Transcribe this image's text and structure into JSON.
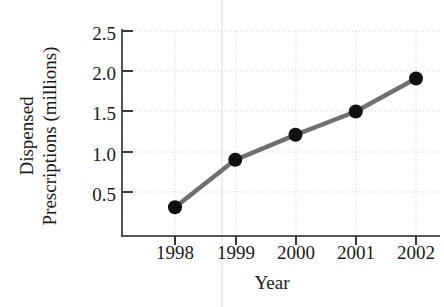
{
  "chart_data": {
    "type": "line",
    "title": "",
    "subtitle": "",
    "xlabel": "Year",
    "ylabel": "Dispensed Prescriptions (millions)",
    "ylabel_lines": [
      "Dispensed",
      "Prescriptions (millions)"
    ],
    "categories": [
      "1998",
      "1999",
      "2000",
      "2001",
      "2002"
    ],
    "x": [
      1998,
      1999,
      2000,
      2001,
      2002
    ],
    "values": [
      0.31,
      0.9,
      1.21,
      1.5,
      1.91
    ],
    "series": [
      {
        "name": "Dispensed Prescriptions",
        "values": [
          0.31,
          0.9,
          1.21,
          1.5,
          1.91
        ]
      }
    ],
    "ytick_labels": [
      "0.5",
      "1.0",
      "1.5",
      "2.0",
      "2.5"
    ],
    "yticks": [
      0.5,
      1.0,
      1.5,
      2.0,
      2.5
    ],
    "xtick_labels": [
      "1998",
      "1999",
      "2000",
      "2001",
      "2002"
    ],
    "ylim": [
      0.0,
      2.68
    ],
    "xlim": [
      1997.75,
      2002.25
    ],
    "grid": true,
    "grid_style": "dotted",
    "legend": false,
    "legend_position": "none",
    "annotations": [],
    "colors": {
      "line": "#707070",
      "marker": "#101010",
      "grid": "#c9c9c9",
      "axis": "#555555",
      "background": "#ffffff",
      "text": "#1a1a1a"
    },
    "marker_style": "circle",
    "line_width": 4
  }
}
